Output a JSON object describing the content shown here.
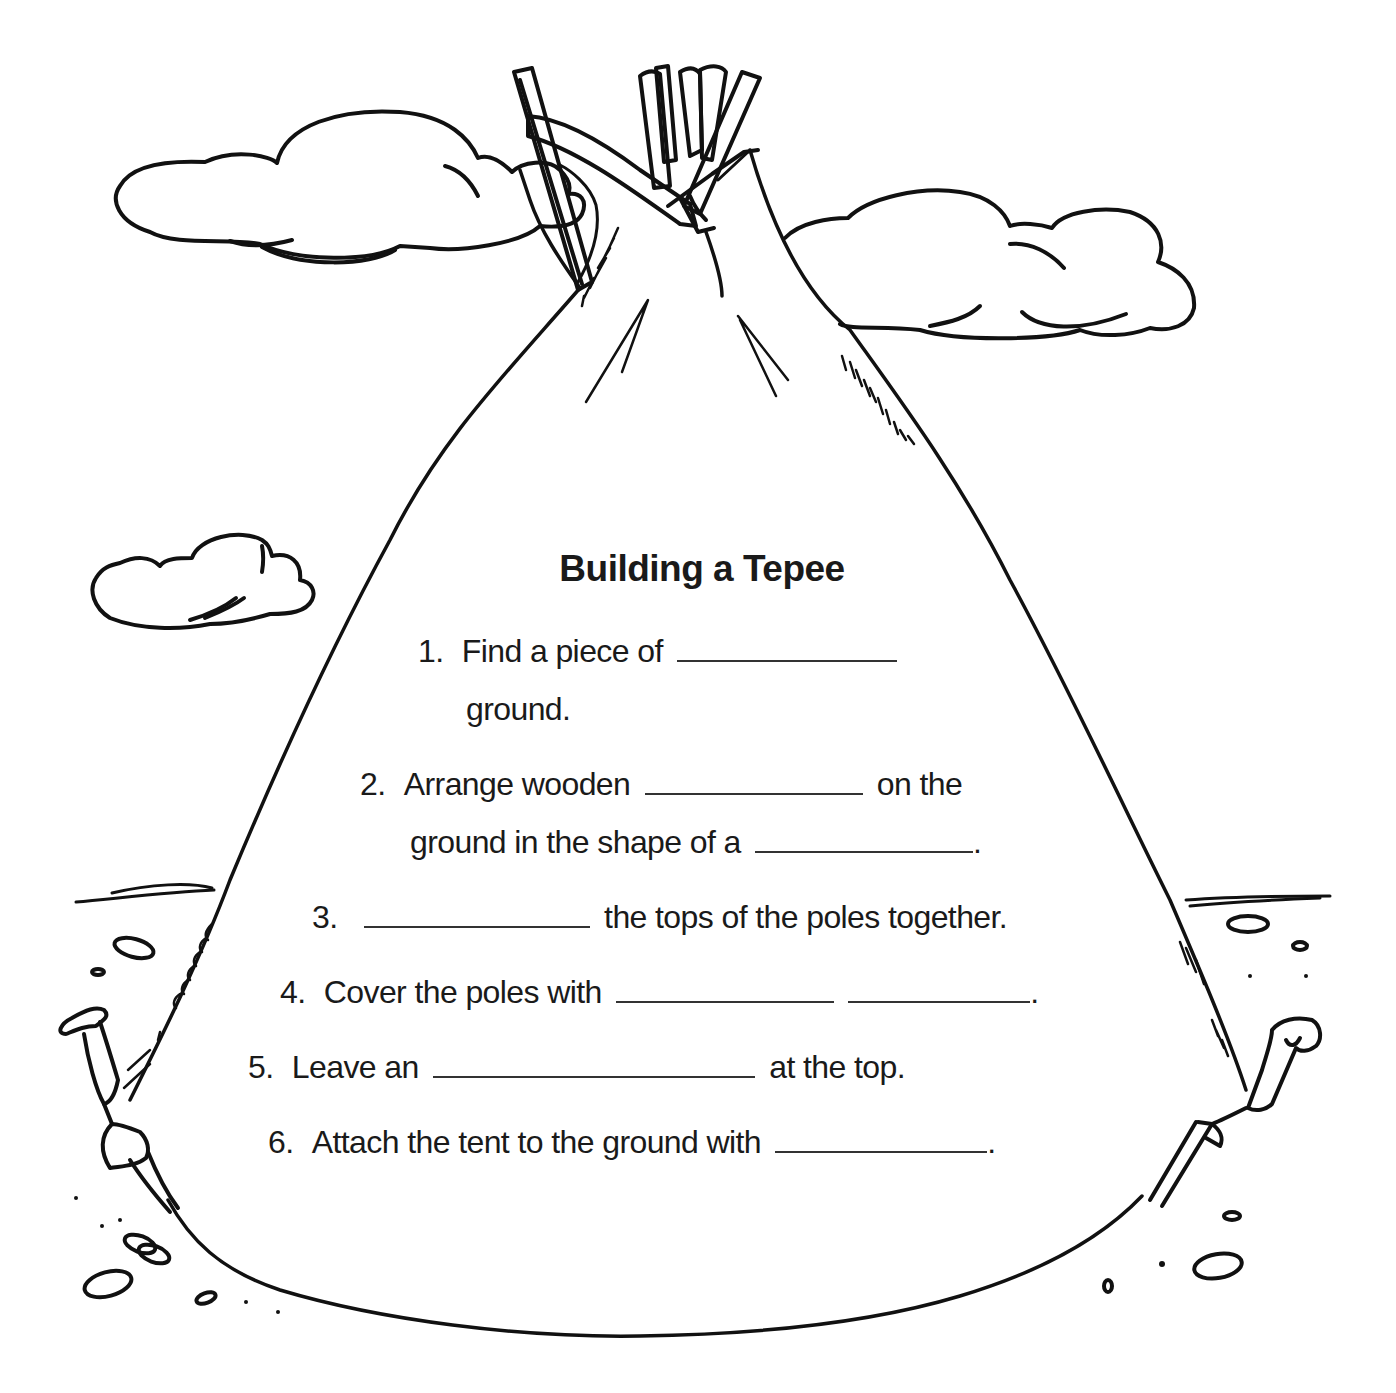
{
  "worksheet": {
    "title": "Building a Tepee",
    "steps": [
      {
        "number": "1.",
        "lines": [
          {
            "segments": [
              {
                "text": "Find a piece of"
              },
              {
                "blank": 220
              }
            ]
          },
          {
            "segments": [
              {
                "text": "ground."
              }
            ]
          }
        ]
      },
      {
        "number": "2.",
        "lines": [
          {
            "segments": [
              {
                "text": "Arrange wooden"
              },
              {
                "blank": 218
              },
              {
                "text": "on the"
              }
            ]
          },
          {
            "segments": [
              {
                "text": "ground in the shape of a"
              },
              {
                "blank": 218
              },
              {
                "text": "."
              }
            ]
          }
        ]
      },
      {
        "number": "3.",
        "lines": [
          {
            "segments": [
              {
                "blank": 226
              },
              {
                "text": "the tops of the poles together."
              }
            ]
          }
        ]
      },
      {
        "number": "4.",
        "lines": [
          {
            "segments": [
              {
                "text": "Cover the poles with"
              },
              {
                "blank": 218
              },
              {
                "blank": 182
              },
              {
                "text": "."
              }
            ]
          }
        ]
      },
      {
        "number": "5.",
        "lines": [
          {
            "segments": [
              {
                "text": "Leave an"
              },
              {
                "blank": 322
              },
              {
                "text": "at the top."
              }
            ]
          }
        ]
      },
      {
        "number": "6.",
        "lines": [
          {
            "segments": [
              {
                "text": "Attach the tent to the ground with"
              },
              {
                "blank": 212
              },
              {
                "text": "."
              }
            ]
          }
        ]
      }
    ],
    "text": {
      "s1_num": "1.",
      "s1_a": "Find a piece of",
      "s1_b": "ground.",
      "s2_num": "2.",
      "s2_a": "Arrange wooden",
      "s2_a_end": "on the",
      "s2_b": "ground in the shape of a",
      "s2_b_end": ".",
      "s3_num": "3.",
      "s3_a": "the tops of the poles together.",
      "s4_num": "4.",
      "s4_a": "Cover the poles with",
      "s4_end": ".",
      "s5_num": "5.",
      "s5_a": "Leave an",
      "s5_end": "at the top.",
      "s6_num": "6.",
      "s6_a": "Attach the tent to the ground with",
      "s6_end": "."
    }
  },
  "illustration": {
    "subject": "tepee-outline",
    "elements": [
      "tepee-cover",
      "crossed-poles",
      "cloud-top-left",
      "cloud-top-right",
      "cloud-mid-left",
      "ground-stakes",
      "pebbles"
    ],
    "line_color": "#111111",
    "background_color": "#ffffff"
  }
}
